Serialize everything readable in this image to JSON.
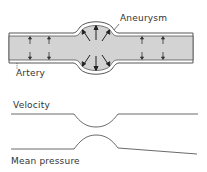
{
  "labels": {
    "aneurysm": "Aneurysm",
    "artery": "Artery",
    "velocity": "Velocity",
    "mean_pressure": "Mean pressure"
  },
  "colors": {
    "vessel_fill": "#d3d3d3",
    "stroke": "#444444",
    "background": "#ffffff"
  }
}
